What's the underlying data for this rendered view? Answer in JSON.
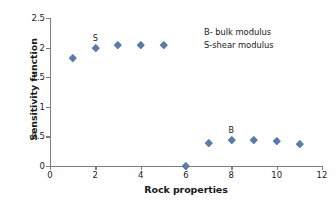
{
  "chart_data": {
    "type": "scatter",
    "title": "",
    "xlabel": "Rock properties",
    "ylabel": "Sensitivity function",
    "xlim": [
      0,
      12
    ],
    "ylim": [
      0,
      2.5
    ],
    "xticks": [
      "0",
      "2",
      "4",
      "6",
      "8",
      "10",
      "12"
    ],
    "xtick_values": [
      0,
      2,
      4,
      6,
      8,
      10,
      12
    ],
    "yticks": [
      "0",
      "0.5",
      "1",
      "1.5",
      "2",
      "2.5"
    ],
    "ytick_values": [
      0,
      0.5,
      1,
      1.5,
      2,
      2.5
    ],
    "grid": false,
    "legend_position": "upper-right-inside",
    "marker": "diamond",
    "marker_color": "#5c7ba8",
    "axis_color": "#7d7d7d",
    "x": [
      1,
      2,
      3,
      4,
      5,
      6,
      7,
      8,
      9,
      10,
      11
    ],
    "y": [
      1.83,
      1.99,
      2.04,
      2.05,
      2.05,
      0.0,
      0.4,
      0.44,
      0.44,
      0.42,
      0.37
    ],
    "point_labels": [
      {
        "x": 2,
        "y": 1.99,
        "text": "S"
      },
      {
        "x": 8,
        "y": 0.44,
        "text": "B"
      }
    ],
    "annotations": [
      "B- bulk modulus",
      "S-shear modulus"
    ]
  }
}
